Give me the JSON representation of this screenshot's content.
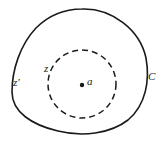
{
  "diagram": {
    "contour_label": "C",
    "inner_circle_label": "z",
    "outer_point_label": "z′",
    "center_label": "a",
    "colors": {
      "stroke": "#1a1a1a",
      "background": "#ffffff"
    }
  }
}
